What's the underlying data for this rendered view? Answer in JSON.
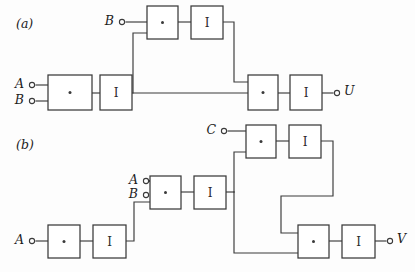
{
  "figure": {
    "width": 415,
    "height": 272,
    "background_color": "#fdfdfd",
    "line_color": "#3a3a3a",
    "text_color": "#1c1c1c"
  },
  "panels": [
    {
      "id": "panel-a",
      "label": "(a)",
      "label_x": 16,
      "label_y": 24,
      "output_signal": "U"
    },
    {
      "id": "panel-b",
      "label": "(b)",
      "label_x": 16,
      "label_y": 145,
      "output_signal": "V"
    }
  ],
  "gates": [
    {
      "id": "a-and-top",
      "panel": "a",
      "kind": "and",
      "glyph": "dot",
      "x": 147,
      "y": 6,
      "w": 31,
      "h": 33
    },
    {
      "id": "a-inv-top",
      "panel": "a",
      "kind": "inverter",
      "glyph": "I",
      "x": 191,
      "y": 6,
      "w": 32,
      "h": 33
    },
    {
      "id": "a-and-left",
      "panel": "a",
      "kind": "and",
      "glyph": "dot",
      "x": 48,
      "y": 75,
      "w": 44,
      "h": 35
    },
    {
      "id": "a-inv-left",
      "panel": "a",
      "kind": "inverter",
      "glyph": "I",
      "x": 100,
      "y": 75,
      "w": 32,
      "h": 35
    },
    {
      "id": "a-and-out",
      "panel": "a",
      "kind": "and",
      "glyph": "dot",
      "x": 248,
      "y": 75,
      "w": 30,
      "h": 35
    },
    {
      "id": "a-inv-out",
      "panel": "a",
      "kind": "inverter",
      "glyph": "I",
      "x": 290,
      "y": 75,
      "w": 32,
      "h": 35
    },
    {
      "id": "b-and-c",
      "panel": "b",
      "kind": "and",
      "glyph": "dot",
      "x": 246,
      "y": 125,
      "w": 30,
      "h": 33
    },
    {
      "id": "b-inv-c",
      "panel": "b",
      "kind": "inverter",
      "glyph": "I",
      "x": 289,
      "y": 125,
      "w": 32,
      "h": 33
    },
    {
      "id": "b-and-mid",
      "panel": "b",
      "kind": "and",
      "glyph": "dot",
      "x": 150,
      "y": 176,
      "w": 31,
      "h": 33
    },
    {
      "id": "b-inv-mid",
      "panel": "b",
      "kind": "inverter",
      "glyph": "I",
      "x": 194,
      "y": 176,
      "w": 32,
      "h": 33
    },
    {
      "id": "b-and-left",
      "panel": "b",
      "kind": "and",
      "glyph": "dot",
      "x": 48,
      "y": 225,
      "w": 32,
      "h": 33
    },
    {
      "id": "b-inv-left",
      "panel": "b",
      "kind": "inverter",
      "glyph": "I",
      "x": 93,
      "y": 225,
      "w": 33,
      "h": 33
    },
    {
      "id": "b-and-out",
      "panel": "b",
      "kind": "and",
      "glyph": "dot",
      "x": 298,
      "y": 225,
      "w": 31,
      "h": 33
    },
    {
      "id": "b-inv-out",
      "panel": "b",
      "kind": "inverter",
      "glyph": "I",
      "x": 342,
      "y": 225,
      "w": 33,
      "h": 33
    }
  ],
  "terminals": [
    {
      "id": "term-a-B-top",
      "panel": "a",
      "label": "B",
      "role": "input",
      "cx": 122,
      "cy": 22,
      "label_x": 114,
      "label_y": 21
    },
    {
      "id": "term-a-A",
      "panel": "a",
      "label": "A",
      "role": "input",
      "cx": 32,
      "cy": 85,
      "label_x": 24,
      "label_y": 84
    },
    {
      "id": "term-a-B",
      "panel": "a",
      "label": "B",
      "role": "input",
      "cx": 32,
      "cy": 101,
      "label_x": 24,
      "label_y": 100
    },
    {
      "id": "term-a-U",
      "panel": "a",
      "label": "U",
      "role": "output",
      "cx": 337,
      "cy": 93,
      "label_x": 344,
      "label_y": 91
    },
    {
      "id": "term-b-C",
      "panel": "b",
      "label": "C",
      "role": "input",
      "cx": 224,
      "cy": 131,
      "label_x": 216,
      "label_y": 130
    },
    {
      "id": "term-b-A-mid",
      "panel": "b",
      "label": "A",
      "role": "input",
      "cx": 146,
      "cy": 181,
      "label_x": 138,
      "label_y": 180
    },
    {
      "id": "term-b-B-mid",
      "panel": "b",
      "label": "B",
      "role": "input",
      "cx": 146,
      "cy": 195,
      "label_x": 138,
      "label_y": 194
    },
    {
      "id": "term-b-A-low",
      "panel": "b",
      "label": "A",
      "role": "input",
      "cx": 32,
      "cy": 241,
      "label_x": 24,
      "label_y": 240
    },
    {
      "id": "term-b-V",
      "panel": "b",
      "label": "V",
      "role": "output",
      "cx": 390,
      "cy": 241,
      "label_x": 397,
      "label_y": 239
    }
  ],
  "wires": [
    {
      "id": "w-a-B-top-in",
      "panel": "a",
      "points": "126,22 147,22"
    },
    {
      "id": "w-a-top-and-inv",
      "panel": "a",
      "points": "178,22 191,22"
    },
    {
      "id": "w-a-A-in",
      "panel": "a",
      "points": "36,85 48,85"
    },
    {
      "id": "w-a-B-in",
      "panel": "a",
      "points": "36,101 48,101"
    },
    {
      "id": "w-a-and-inv-left",
      "panel": "a",
      "points": "92,93 100,93"
    },
    {
      "id": "w-a-inv-left-out",
      "panel": "a",
      "points": "132,93 248,93"
    },
    {
      "id": "w-a-branch-up",
      "panel": "a",
      "points": "133,93 133,33 147,33"
    },
    {
      "id": "w-a-top-feedback",
      "panel": "a",
      "points": "223,22 234,22 234,82 248,82"
    },
    {
      "id": "w-a-out-and-inv",
      "panel": "a",
      "points": "278,93 290,93"
    },
    {
      "id": "w-a-out-U",
      "panel": "a",
      "points": "322,93 333,93"
    },
    {
      "id": "w-b-C-in",
      "panel": "b",
      "points": "228,131 246,131"
    },
    {
      "id": "w-b-c-and-inv",
      "panel": "b",
      "points": "276,141 289,141"
    },
    {
      "id": "w-b-A-mid-in",
      "panel": "b",
      "points": "150,181 150,181"
    },
    {
      "id": "w-b-A-mid-lead",
      "panel": "b",
      "points": "150,181 150,181"
    },
    {
      "id": "w-b-A-mid-wire",
      "panel": "b",
      "points": "150,181 150,181"
    },
    {
      "id": "w-b-A-lead",
      "panel": "b",
      "points": "150,181 150,181"
    },
    {
      "id": "w-b-A-mid-link",
      "panel": "b",
      "points": "150,181 150,181"
    },
    {
      "id": "w-b-A-stub",
      "panel": "b",
      "points": "150,181 150,181"
    },
    {
      "id": "w-b-in-A-mid",
      "panel": "b",
      "points": "150,181 150,181"
    },
    {
      "id": "w-b-A-to-and",
      "panel": "b",
      "points": "150,181 150,181"
    },
    {
      "id": "w-b-A-mid-conn",
      "panel": "b",
      "points": "150,181 150,181"
    },
    {
      "id": "w-b-mid-A-line",
      "panel": "b",
      "points": "150,181 150,181"
    },
    {
      "id": "w-b-A-midterm",
      "panel": "b",
      "points": "150,181 150,181"
    },
    {
      "id": "w-b-mid-and-inv",
      "panel": "b",
      "points": "181,192 194,192"
    },
    {
      "id": "w-b-A-low-in",
      "panel": "b",
      "points": "36,241 48,241"
    },
    {
      "id": "w-b-low-and-inv",
      "panel": "b",
      "points": "80,241 93,241"
    },
    {
      "id": "w-b-low-to-mid",
      "panel": "b",
      "points": "126,241 134,241 134,202 150,202"
    },
    {
      "id": "w-b-mid-trunk",
      "panel": "b",
      "points": "226,192 234,192"
    },
    {
      "id": "w-b-trunk-up",
      "panel": "b",
      "points": "234,192 234,152 246,152"
    },
    {
      "id": "w-b-trunk-down",
      "panel": "b",
      "points": "234,192 234,253 298,253"
    },
    {
      "id": "w-b-c-feedback",
      "panel": "b",
      "points": "321,141 333,141 333,196 281,196 281,233 298,233"
    },
    {
      "id": "w-b-out-and-inv",
      "panel": "b",
      "points": "329,241 342,241"
    },
    {
      "id": "w-b-out-V",
      "panel": "b",
      "points": "375,241 386,241"
    }
  ]
}
